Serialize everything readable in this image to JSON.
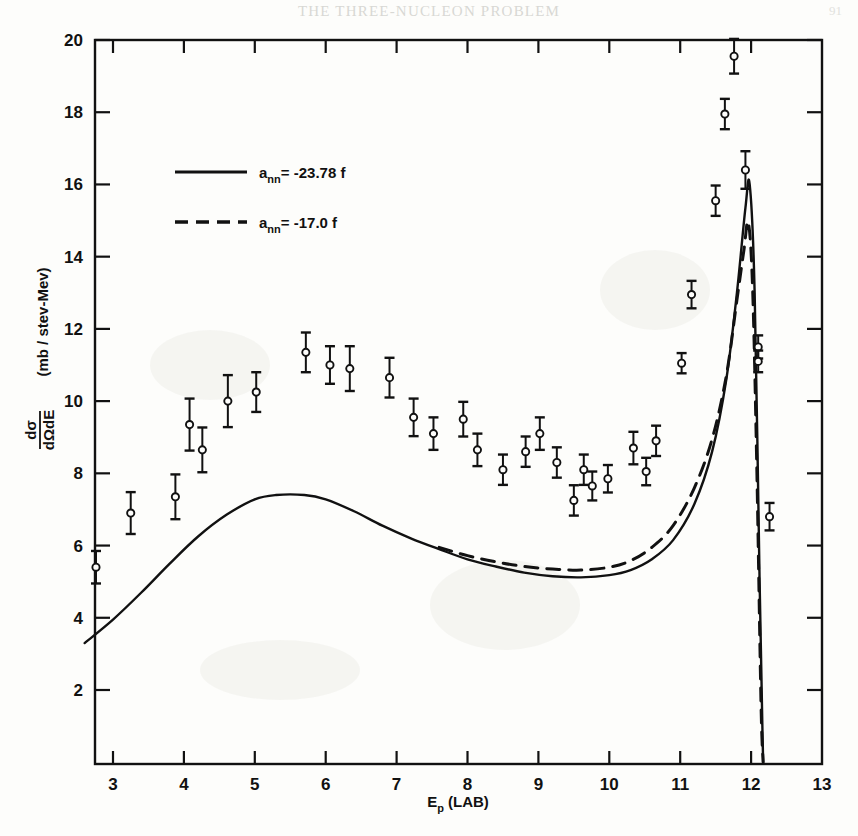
{
  "page": {
    "running_head": "THE THREE-NUCLEON PROBLEM",
    "page_number": "91"
  },
  "axes": {
    "x_label": "E",
    "x_label_sub": "p",
    "x_label_tail": "(LAB)",
    "y_label_num": "dσ",
    "y_label_den": "dΩdE",
    "y_label_units": "(mb / stev-Mev)",
    "x_ticks": [
      "3",
      "4",
      "5",
      "6",
      "7",
      "8",
      "9",
      "10",
      "11",
      "12",
      "13"
    ],
    "y_ticks": [
      "2",
      "4",
      "6",
      "8",
      "10",
      "12",
      "14",
      "16",
      "18",
      "20"
    ]
  },
  "legend": {
    "entries": [
      {
        "style": "solid",
        "symbol": "a",
        "sub": "nn",
        "eq": "= -23.78 f"
      },
      {
        "style": "dashed",
        "symbol": "a",
        "sub": "nn",
        "eq": "= -17.0 f"
      }
    ]
  },
  "chart_data": {
    "type": "scatter",
    "title": "",
    "xlabel": "Ep (LAB)",
    "ylabel": "dσ/dΩdE (mb/stev-Mev)",
    "xlim": [
      2.55,
      13.0
    ],
    "ylim": [
      0,
      20
    ],
    "xticks": [
      3,
      4,
      5,
      6,
      7,
      8,
      9,
      10,
      11,
      12,
      13
    ],
    "yticks": [
      2,
      4,
      6,
      8,
      10,
      12,
      14,
      16,
      18,
      20
    ],
    "grid": false,
    "legend_position": "upper-left",
    "series": [
      {
        "name": "experimental data",
        "type": "scatter",
        "marker": "open-circle",
        "errorbars": true,
        "points": [
          {
            "x": 2.76,
            "y": 5.4,
            "yerr": 0.45
          },
          {
            "x": 3.25,
            "y": 6.9,
            "yerr": 0.58
          },
          {
            "x": 3.88,
            "y": 7.35,
            "yerr": 0.62
          },
          {
            "x": 4.08,
            "y": 9.35,
            "yerr": 0.72
          },
          {
            "x": 4.26,
            "y": 8.65,
            "yerr": 0.62
          },
          {
            "x": 4.62,
            "y": 10.0,
            "yerr": 0.72
          },
          {
            "x": 5.02,
            "y": 10.25,
            "yerr": 0.55
          },
          {
            "x": 5.72,
            "y": 11.35,
            "yerr": 0.55
          },
          {
            "x": 6.06,
            "y": 11.0,
            "yerr": 0.52
          },
          {
            "x": 6.34,
            "y": 10.9,
            "yerr": 0.62
          },
          {
            "x": 6.9,
            "y": 10.65,
            "yerr": 0.55
          },
          {
            "x": 7.24,
            "y": 9.55,
            "yerr": 0.52
          },
          {
            "x": 7.52,
            "y": 9.1,
            "yerr": 0.45
          },
          {
            "x": 7.94,
            "y": 9.5,
            "yerr": 0.48
          },
          {
            "x": 8.14,
            "y": 8.65,
            "yerr": 0.45
          },
          {
            "x": 8.5,
            "y": 8.1,
            "yerr": 0.42
          },
          {
            "x": 8.82,
            "y": 8.6,
            "yerr": 0.42
          },
          {
            "x": 9.02,
            "y": 9.1,
            "yerr": 0.45
          },
          {
            "x": 9.26,
            "y": 8.3,
            "yerr": 0.42
          },
          {
            "x": 9.5,
            "y": 7.25,
            "yerr": 0.42
          },
          {
            "x": 9.64,
            "y": 8.1,
            "yerr": 0.42
          },
          {
            "x": 9.76,
            "y": 7.65,
            "yerr": 0.4
          },
          {
            "x": 9.98,
            "y": 7.85,
            "yerr": 0.38
          },
          {
            "x": 10.34,
            "y": 8.7,
            "yerr": 0.45
          },
          {
            "x": 10.52,
            "y": 8.05,
            "yerr": 0.38
          },
          {
            "x": 10.66,
            "y": 8.9,
            "yerr": 0.42
          },
          {
            "x": 11.02,
            "y": 11.05,
            "yerr": 0.28
          },
          {
            "x": 11.16,
            "y": 12.95,
            "yerr": 0.38
          },
          {
            "x": 11.5,
            "y": 15.55,
            "yerr": 0.42
          },
          {
            "x": 11.63,
            "y": 17.95,
            "yerr": 0.42
          },
          {
            "x": 11.76,
            "y": 19.55,
            "yerr": 0.48
          },
          {
            "x": 11.92,
            "y": 16.4,
            "yerr": 0.52
          },
          {
            "x": 12.1,
            "y": 11.5,
            "yerr": 0.32
          },
          {
            "x": 12.1,
            "y": 11.1,
            "yerr": 0.3
          },
          {
            "x": 12.26,
            "y": 6.8,
            "yerr": 0.38
          }
        ]
      },
      {
        "name": "a_nn = -23.78 f",
        "type": "line",
        "style": "solid",
        "x": [
          2.6,
          3.0,
          3.4,
          3.8,
          4.2,
          4.6,
          5.0,
          5.3,
          5.7,
          6.0,
          6.4,
          6.8,
          7.2,
          7.6,
          8.0,
          8.4,
          8.8,
          9.2,
          9.6,
          10.0,
          10.3,
          10.6,
          10.9,
          11.2,
          11.45,
          11.65,
          11.8,
          11.92,
          11.98,
          12.05,
          12.12,
          12.16,
          12.17
        ],
        "y": [
          3.3,
          3.95,
          4.7,
          5.5,
          6.25,
          6.85,
          7.28,
          7.4,
          7.4,
          7.28,
          6.95,
          6.55,
          6.2,
          5.9,
          5.62,
          5.42,
          5.25,
          5.15,
          5.12,
          5.18,
          5.32,
          5.62,
          6.15,
          7.15,
          8.6,
          10.6,
          13.0,
          15.35,
          16.0,
          13.0,
          5.0,
          0.9,
          0.0
        ]
      },
      {
        "name": "a_nn = -17.0 f",
        "type": "line",
        "style": "dashed",
        "x": [
          7.6,
          8.0,
          8.4,
          8.8,
          9.2,
          9.6,
          10.0,
          10.3,
          10.6,
          10.9,
          11.2,
          11.45,
          11.65,
          11.8,
          11.9,
          11.96,
          12.02,
          12.08,
          12.14,
          12.17
        ],
        "y": [
          5.95,
          5.72,
          5.55,
          5.42,
          5.35,
          5.32,
          5.4,
          5.58,
          5.95,
          6.55,
          7.6,
          8.95,
          10.7,
          12.8,
          14.2,
          14.95,
          13.2,
          8.2,
          1.6,
          0.0
        ]
      }
    ]
  }
}
